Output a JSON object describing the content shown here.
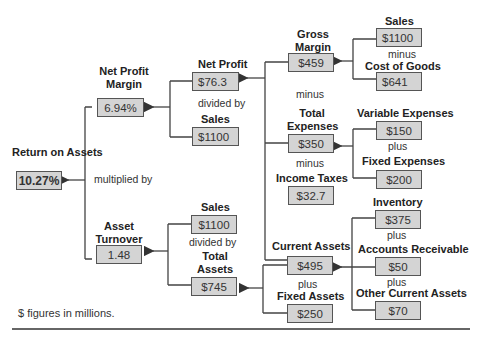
{
  "diagram": {
    "root": {
      "label": "Return on Assets",
      "value": "10.27%"
    },
    "root_operator": "multiplied by",
    "net_profit_margin": {
      "label": "Net Profit Margin",
      "value": "6.94%",
      "operator": "divided by"
    },
    "net_profit": {
      "label": "Net Profit",
      "value": "$76.3"
    },
    "npm_sales": {
      "label": "Sales",
      "value": "$1100"
    },
    "gross_margin": {
      "label": "Gross Margin",
      "value": "$459",
      "operator_below": "minus"
    },
    "gm_sales": {
      "label": "Sales",
      "value": "$1100",
      "operator": "minus"
    },
    "cost_of_goods": {
      "label": "Cost of Goods",
      "value": "$641"
    },
    "total_expenses": {
      "label": "Total Expenses",
      "value": "$350",
      "operator_below": "minus"
    },
    "variable_expenses": {
      "label": "Variable Expenses",
      "value": "$150",
      "operator": "plus"
    },
    "fixed_expenses": {
      "label": "Fixed Expenses",
      "value": "$200"
    },
    "income_taxes": {
      "label": "Income Taxes",
      "value": "$32.7"
    },
    "asset_turnover": {
      "label": "Asset Turnover",
      "value": "1.48",
      "operator": "divided by"
    },
    "at_sales": {
      "label": "Sales",
      "value": "$1100"
    },
    "total_assets": {
      "label": "Total Assets",
      "value": "$745"
    },
    "current_assets": {
      "label": "Current Assets",
      "value": "$495",
      "operator": "plus"
    },
    "fixed_assets": {
      "label": "Fixed Assets",
      "value": "$250"
    },
    "inventory": {
      "label": "Inventory",
      "value": "$375",
      "operator": "plus"
    },
    "accounts_receivable": {
      "label": "Accounts Receivable",
      "value": "$50",
      "operator": "plus"
    },
    "other_current_assets": {
      "label": "Other Current Assets",
      "value": "$70"
    },
    "footnote": "$ figures in millions."
  }
}
